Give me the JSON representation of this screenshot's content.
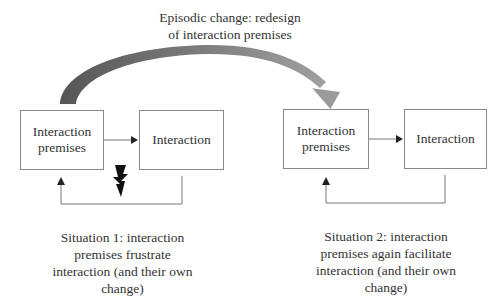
{
  "title": {
    "line1": "Episodic change: redesign",
    "line2": "of interaction premises"
  },
  "situation1": {
    "box_premises": {
      "line1": "Interaction",
      "line2": "premises"
    },
    "box_interaction": "Interaction",
    "caption": [
      "Situation 1: interaction",
      "premises frustrate",
      "interaction (and their own",
      "change)"
    ],
    "disruption_icon": "lightning-bolt"
  },
  "situation2": {
    "box_premises": {
      "line1": "Interaction",
      "line2": "premises"
    },
    "box_interaction": "Interaction",
    "caption": [
      "Situation 2: interaction",
      "premises again facilitate",
      "interaction (and their own",
      "change)"
    ]
  },
  "colors": {
    "arrow_dark": "#555555",
    "arrow_light": "#9a9a9a",
    "box_border": "#888888",
    "line": "#777777",
    "text": "#333333"
  }
}
